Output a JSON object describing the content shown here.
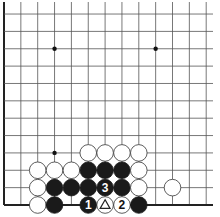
{
  "board": {
    "origin_x": 4,
    "origin_y_bottom": 205,
    "spacing_x": 16.85,
    "spacing_y": 17.36,
    "cols": 13,
    "rows": 12,
    "left_edge": true,
    "bottom_edge": true,
    "line_extend_right": 213,
    "line_extend_top": 2,
    "stone_radius": 8.3
  },
  "hoshi": [
    {
      "col": 3,
      "row": 9
    },
    {
      "col": 9,
      "row": 9
    },
    {
      "col": 3,
      "row": 3
    }
  ],
  "stones": [
    {
      "col": 5,
      "row": 3,
      "color": "white"
    },
    {
      "col": 6,
      "row": 3,
      "color": "white"
    },
    {
      "col": 7,
      "row": 3,
      "color": "white"
    },
    {
      "col": 8,
      "row": 3,
      "color": "white"
    },
    {
      "col": 2,
      "row": 2,
      "color": "white"
    },
    {
      "col": 3,
      "row": 2,
      "color": "white"
    },
    {
      "col": 4,
      "row": 2,
      "color": "white"
    },
    {
      "col": 5,
      "row": 2,
      "color": "black"
    },
    {
      "col": 6,
      "row": 2,
      "color": "black"
    },
    {
      "col": 7,
      "row": 2,
      "color": "black"
    },
    {
      "col": 8,
      "row": 2,
      "color": "white"
    },
    {
      "col": 2,
      "row": 1,
      "color": "white"
    },
    {
      "col": 3,
      "row": 1,
      "color": "black"
    },
    {
      "col": 4,
      "row": 1,
      "color": "black"
    },
    {
      "col": 5,
      "row": 1,
      "color": "black"
    },
    {
      "col": 6,
      "row": 1,
      "color": "black",
      "label": "3"
    },
    {
      "col": 7,
      "row": 1,
      "color": "black"
    },
    {
      "col": 8,
      "row": 1,
      "color": "white"
    },
    {
      "col": 10,
      "row": 1,
      "color": "white"
    },
    {
      "col": 2,
      "row": 0,
      "color": "white"
    },
    {
      "col": 3,
      "row": 0,
      "color": "black"
    },
    {
      "col": 5,
      "row": 0,
      "color": "black",
      "label": "1"
    },
    {
      "col": 6,
      "row": 0,
      "color": "white",
      "mark": "triangle"
    },
    {
      "col": 7,
      "row": 0,
      "color": "white",
      "label": "2"
    },
    {
      "col": 8,
      "row": 0,
      "color": "black"
    }
  ]
}
